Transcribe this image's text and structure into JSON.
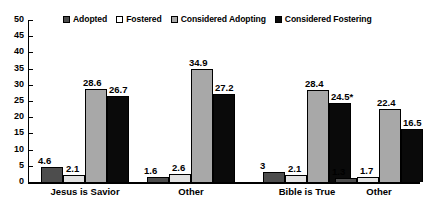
{
  "chart_data": {
    "type": "bar",
    "title": "",
    "xlabel": "",
    "ylabel": "",
    "ylim": [
      0,
      50
    ],
    "yticks": [
      0,
      5,
      10,
      15,
      20,
      25,
      30,
      35,
      40,
      45,
      50
    ],
    "grid": false,
    "legend_position": "top-center",
    "categories": [
      "Jesus is Savior",
      "Other",
      "Bible is True",
      "Other"
    ],
    "series": [
      {
        "name": "Adopted",
        "color": "#4d4d4d",
        "values": [
          4.6,
          1.6,
          3,
          1.3
        ],
        "labels": [
          "4.6",
          "1.6",
          "3",
          "1.3"
        ]
      },
      {
        "name": "Fostered",
        "color": "#e2e2e2",
        "values": [
          2.1,
          2.6,
          2.1,
          1.7
        ],
        "labels": [
          "2.1",
          "2.6",
          "2.1",
          "1.7"
        ]
      },
      {
        "name": "Considered Adopting",
        "color": "#a8a8a8",
        "values": [
          28.6,
          34.9,
          28.4,
          22.4
        ],
        "labels": [
          "28.6",
          "34.9",
          "28.4",
          "22.4"
        ]
      },
      {
        "name": "Considered Fostering",
        "color": "#0a0a0a",
        "values": [
          26.7,
          27.2,
          24.5,
          16.5
        ],
        "labels": [
          "26.7",
          "27.2",
          "24.5*",
          "16.5"
        ]
      }
    ],
    "annotations": [
      "* value marked with asterisk"
    ]
  },
  "axis": {
    "tick_0": "0",
    "tick_1": "5",
    "tick_2": "10",
    "tick_3": "15",
    "tick_4": "20",
    "tick_5": "25",
    "tick_6": "30",
    "tick_7": "35",
    "tick_8": "40",
    "tick_9": "45",
    "tick_10": "50"
  }
}
